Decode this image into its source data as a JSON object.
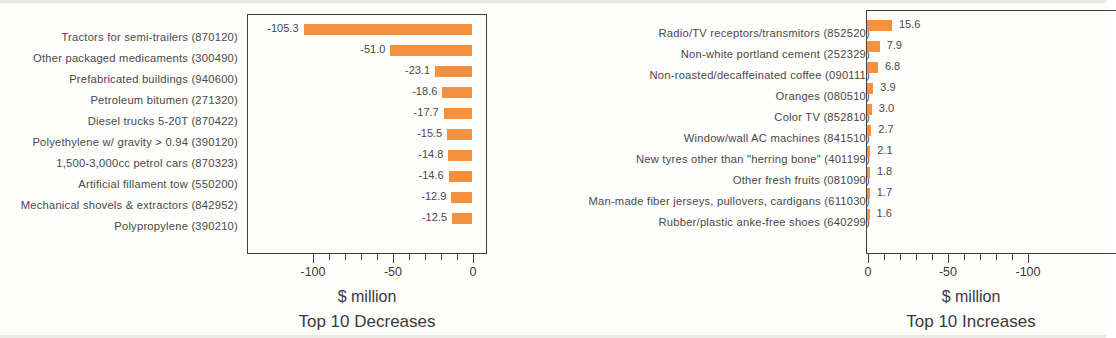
{
  "chart_data": [
    {
      "type": "bar",
      "title": "Top 10 Decreases",
      "xlabel": "$ million",
      "ylabel": "",
      "orientation": "horizontal",
      "direction": "left",
      "xlim": [
        -120,
        0
      ],
      "xticks": [
        -100,
        -50,
        0
      ],
      "xticklabels": [
        "-100",
        "-50",
        "0"
      ],
      "minor_ticks_between": 4,
      "grid": false,
      "legend": false,
      "bar_color": "#f4913e",
      "categories": [
        "Tractors for semi-trailers (870120)",
        "Other packaged medicaments (300490)",
        "Prefabricated buildings (940600)",
        "Petroleum bitumen (271320)",
        "Diesel trucks 5-20T (870422)",
        "Polyethylene w/ gravity > 0.94 (390120)",
        "1,500-3,000cc petrol cars (870323)",
        "Artificial fillament tow (550200)",
        "Mechanical shovels & extractors (842952)",
        "Polypropylene (390210)"
      ],
      "values": [
        -105.3,
        -51.0,
        -23.1,
        -18.6,
        -17.7,
        -15.5,
        -14.8,
        -14.6,
        -12.9,
        -12.5
      ],
      "value_labels": [
        "-105.3",
        "-51.0",
        "-23.1",
        "-18.6",
        "-17.7",
        "-15.5",
        "-14.8",
        "-14.6",
        "-12.9",
        "-12.5"
      ]
    },
    {
      "type": "bar",
      "title": "Top 10 Increases",
      "xlabel": "$ million",
      "ylabel": "",
      "orientation": "horizontal",
      "direction": "right",
      "xlim": [
        0,
        156
      ],
      "xticks": [
        0,
        50,
        100
      ],
      "xticklabels": [
        "0",
        "-50",
        "-100"
      ],
      "minor_ticks_between": 4,
      "grid": false,
      "legend": false,
      "bar_color": "#f4913e",
      "categories": [
        "Radio/TV receptors/transmitors (852520)",
        "Non-white portland cement (252329)",
        "Non-roasted/decaffeinated coffee (090111)",
        "Oranges (080510)",
        "Color TV (852810)",
        "Window/wall AC machines (841510)",
        "New tyres other than \"herring bone\" (401199)",
        "Other fresh fruits (081090)",
        "Man-made fiber jerseys, pullovers, cardigans (611030)",
        "Rubber/plastic anke-free shoes (640299)"
      ],
      "values": [
        15.6,
        7.9,
        6.8,
        3.9,
        3.0,
        2.7,
        2.1,
        1.8,
        1.7,
        1.6
      ],
      "value_labels": [
        "15.6",
        "7.9",
        "6.8",
        "3.9",
        "3.0",
        "2.7",
        "2.1",
        "1.8",
        "1.7",
        "1.6"
      ]
    }
  ]
}
